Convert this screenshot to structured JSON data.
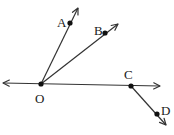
{
  "diagram": {
    "type": "geometry-rays",
    "colors": {
      "stroke": "#333333",
      "point": "#111111",
      "label": "#1a1a1a",
      "background": "#ffffff"
    },
    "points": [
      {
        "id": "O",
        "label": "O",
        "x": 41,
        "y": 84,
        "lx": 35,
        "ly": 103
      },
      {
        "id": "A",
        "label": "A",
        "x": 70,
        "y": 23,
        "lx": 57,
        "ly": 27
      },
      {
        "id": "B",
        "label": "B",
        "x": 105,
        "y": 33,
        "lx": 94,
        "ly": 35
      },
      {
        "id": "C",
        "label": "C",
        "x": 131,
        "y": 86,
        "lx": 124,
        "ly": 79
      },
      {
        "id": "D",
        "label": "D",
        "x": 157,
        "y": 114,
        "lx": 161,
        "ly": 115
      }
    ],
    "rays": [
      {
        "name": "ray-OA",
        "from": "O",
        "through": "A",
        "tip": [
          78,
          8
        ]
      },
      {
        "name": "ray-OB",
        "from": "O",
        "through": "B",
        "tip": [
          118,
          24
        ]
      },
      {
        "name": "ray-CD",
        "from": "C",
        "through": "D",
        "tip": [
          166,
          125
        ]
      }
    ],
    "lines": [
      {
        "name": "line-OC",
        "through": [
          "O",
          "C"
        ],
        "tip_left": [
          3,
          83
        ],
        "tip_right": [
          160,
          86
        ]
      }
    ]
  }
}
